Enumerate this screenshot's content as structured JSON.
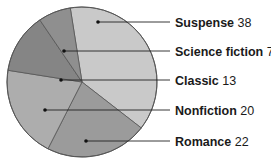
{
  "chart_data": {
    "type": "pie",
    "title": "",
    "unit": "",
    "slices": [
      {
        "label": "Suspense",
        "value": 38,
        "color": "#c9c9c9"
      },
      {
        "label": "Romance",
        "value": 22,
        "color": "#9b9b9b"
      },
      {
        "label": "Nonfiction",
        "value": 20,
        "color": "#adadad"
      },
      {
        "label": "Classic",
        "value": 13,
        "color": "#858585"
      },
      {
        "label": "Science fiction",
        "value": 7,
        "color": "#8f8f8f"
      }
    ],
    "label_order": [
      "Suspense",
      "Science fiction",
      "Classic",
      "Nonfiction",
      "Romance"
    ],
    "start_angle_deg": -9,
    "direction": "clockwise",
    "legend": "right, leader lines"
  }
}
